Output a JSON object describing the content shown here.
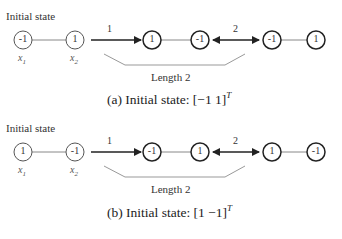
{
  "panels": [
    {
      "id": "a",
      "header": "Initial state",
      "variables": [
        "x",
        "x"
      ],
      "variable_subs": [
        "1",
        "2"
      ],
      "initial_nodes": [
        "-1",
        "1"
      ],
      "step1_label": "1",
      "step1_nodes": [
        "1",
        "-1"
      ],
      "step2_label": "2",
      "step2_nodes": [
        "-1",
        "1"
      ],
      "brace_label": "Length 2",
      "caption_prefix": "(a) Initial state: ",
      "caption_math": "[−1 1]",
      "caption_sup": "T"
    },
    {
      "id": "b",
      "header": "Initial state",
      "variables": [
        "x",
        "x"
      ],
      "variable_subs": [
        "1",
        "2"
      ],
      "initial_nodes": [
        "1",
        "-1"
      ],
      "step1_label": "1",
      "step1_nodes": [
        "-1",
        "1"
      ],
      "step2_label": "2",
      "step2_nodes": [
        "1",
        "-1"
      ],
      "brace_label": "Length 2",
      "caption_prefix": "(b) Initial state: ",
      "caption_math": "[1 −1]",
      "caption_sup": "T"
    }
  ],
  "colors": {
    "stroke": "#222222",
    "link": "#888888",
    "brace": "#999999"
  }
}
